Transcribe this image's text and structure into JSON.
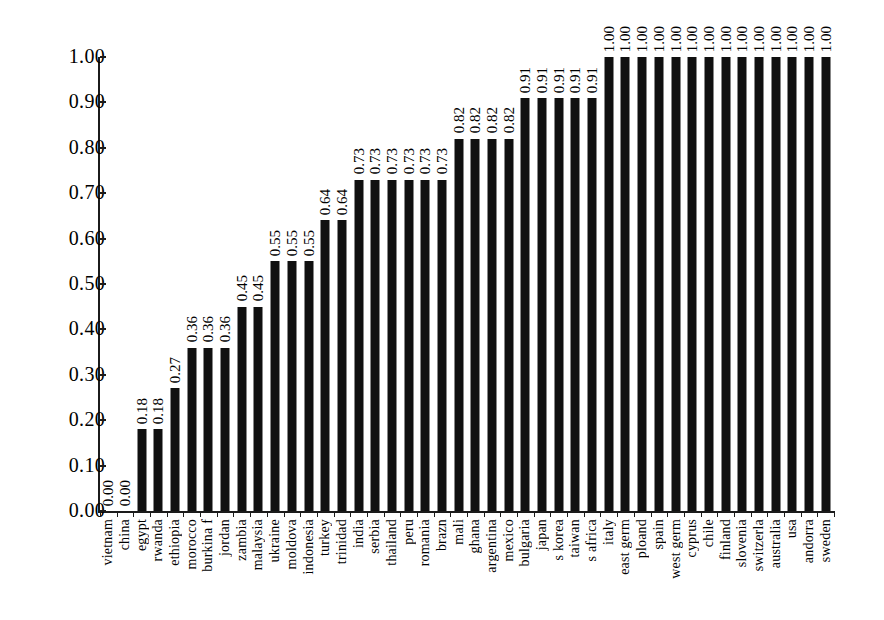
{
  "chart_data": {
    "type": "bar",
    "title": "",
    "subtitle": "",
    "xlabel": "",
    "ylabel": "",
    "ylim": [
      0.0,
      1.0
    ],
    "grid": false,
    "legend": false,
    "y_ticks": [
      "0.00",
      "0.10",
      "0.20",
      "0.30",
      "0.40",
      "0.50",
      "0.60",
      "0.70",
      "0.80",
      "0.90",
      "1.00"
    ],
    "bar_color": "#101010",
    "axis_color": "#1b1b1b",
    "categories": [
      "vietnam",
      "china",
      "egypt",
      "rwanda",
      "ethiopia",
      "morocco",
      "burkina f",
      "jordan",
      "zambia",
      "malaysia",
      "ukraine",
      "moldova",
      "indonesia",
      "turkey",
      "trinidad",
      "india",
      "serbia",
      "thailand",
      "peru",
      "romania",
      "brazn",
      "mali",
      "ghana",
      "argentina",
      "mexico",
      "bulgaria",
      "japan",
      "s korea",
      "taiwan",
      "s africa",
      "italy",
      "east germ",
      "ploand",
      "spain",
      "west germ",
      "cyprus",
      "chile",
      "finland",
      "slovenia",
      "switzerla",
      "australia",
      "usa",
      "andorra",
      "sweden"
    ],
    "values": [
      0.0,
      0.0,
      0.18,
      0.18,
      0.27,
      0.36,
      0.36,
      0.36,
      0.45,
      0.45,
      0.55,
      0.55,
      0.55,
      0.64,
      0.64,
      0.73,
      0.73,
      0.73,
      0.73,
      0.73,
      0.73,
      0.82,
      0.82,
      0.82,
      0.82,
      0.91,
      0.91,
      0.91,
      0.91,
      0.91,
      1.0,
      1.0,
      1.0,
      1.0,
      1.0,
      1.0,
      1.0,
      1.0,
      1.0,
      1.0,
      1.0,
      1.0,
      1.0,
      1.0
    ],
    "value_labels": [
      "0.00",
      "0.00",
      "0.18",
      "0.18",
      "0.27",
      "0.36",
      "0.36",
      "0.36",
      "0.45",
      "0.45",
      "0.55",
      "0.55",
      "0.55",
      "0.64",
      "0.64",
      "0.73",
      "0.73",
      "0.73",
      "0.73",
      "0.73",
      "0.73",
      "0.82",
      "0.82",
      "0.82",
      "0.82",
      "0.91",
      "0.91",
      "0.91",
      "0.91",
      "0.91",
      "1.00",
      "1.00",
      "1.00",
      "1.00",
      "1.00",
      "1.00",
      "1.00",
      "1.00",
      "1.00",
      "1.00",
      "1.00",
      "1.00",
      "1.00",
      "1.00"
    ]
  }
}
